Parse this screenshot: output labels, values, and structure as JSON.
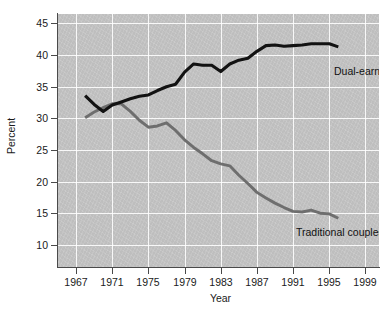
{
  "chart_data": {
    "type": "line",
    "title": "",
    "subtitle": "",
    "xlabel": "Year",
    "ylabel": "Percent",
    "xlim": [
      1965,
      2000.5
    ],
    "ylim": [
      6.5,
      46.5
    ],
    "xticks": [
      "1967",
      "1971",
      "1975",
      "1979",
      "1983",
      "1987",
      "1991",
      "1995",
      "1999"
    ],
    "xtick_values": [
      1967,
      1971,
      1975,
      1979,
      1983,
      1987,
      1991,
      1995,
      1999
    ],
    "yticks": [
      "10",
      "15",
      "20",
      "25",
      "30",
      "35",
      "40",
      "45"
    ],
    "ytick_values": [
      10,
      15,
      20,
      25,
      30,
      35,
      40,
      45
    ],
    "grid": true,
    "grid_color": "#ffffff",
    "plot_background": "#c6c6c6",
    "legend_position": "inline-annotation",
    "x": [
      1968,
      1969,
      1970,
      1971,
      1972,
      1973,
      1974,
      1975,
      1976,
      1977,
      1978,
      1979,
      1980,
      1981,
      1982,
      1983,
      1984,
      1985,
      1986,
      1987,
      1988,
      1989,
      1990,
      1991,
      1992,
      1993,
      1994,
      1995,
      1996
    ],
    "series": [
      {
        "name": "Dual-earner couples",
        "color": "#121212",
        "annotation": "Dual-earner couples",
        "values": [
          33.6,
          32.2,
          31.1,
          32.1,
          32.6,
          33.1,
          33.5,
          33.7,
          34.4,
          35.0,
          35.4,
          37.3,
          38.6,
          38.4,
          38.4,
          37.4,
          38.6,
          39.2,
          39.5,
          40.6,
          41.5,
          41.6,
          41.4,
          41.5,
          41.6,
          41.8,
          41.8,
          41.8,
          41.3
        ]
      },
      {
        "name": "Traditional couples",
        "color": "#6e6e6e",
        "annotation": "Traditional couples",
        "values": [
          30.1,
          31.0,
          31.7,
          32.3,
          32.3,
          31.1,
          29.7,
          28.6,
          28.8,
          29.3,
          28.1,
          26.6,
          25.4,
          24.4,
          23.3,
          22.8,
          22.5,
          21.0,
          19.7,
          18.3,
          17.4,
          16.6,
          15.9,
          15.3,
          15.2,
          15.5,
          15.0,
          14.9,
          14.2
        ]
      }
    ]
  }
}
